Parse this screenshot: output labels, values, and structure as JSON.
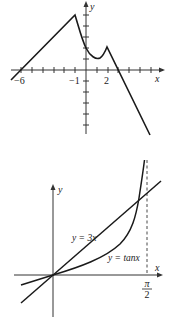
{
  "figures": [
    {
      "id": "piecewise-graph",
      "axes": {
        "x_label": "x",
        "y_label": "y"
      },
      "x_tick_labels": [
        "-6",
        "-1",
        "2"
      ],
      "x_tick_label_display": [
        "−6",
        "−1",
        "2"
      ]
    },
    {
      "id": "tan-vs-3x-graph",
      "axes": {
        "x_label": "x",
        "y_label": "y"
      },
      "curve_labels": {
        "line": "y = 3x",
        "tan": "y = tanx"
      },
      "asymptote_label": {
        "numerator": "π",
        "denominator": "2"
      }
    }
  ],
  "colors": {
    "stroke": "#1a1a1a",
    "axis": "#333333",
    "background": "#ffffff"
  }
}
